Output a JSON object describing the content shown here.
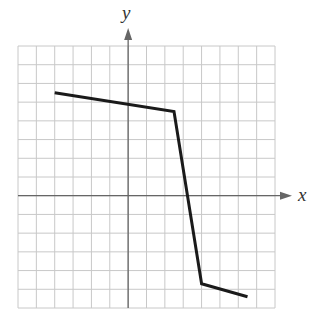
{
  "chart_data": {
    "type": "line",
    "title": "",
    "xlabel": "x",
    "ylabel": "y",
    "xlim": [
      -6,
      8
    ],
    "ylim": [
      -6,
      8
    ],
    "grid": true,
    "grid_step": 1,
    "tick_labels": false,
    "series": [
      {
        "name": "piecewise-linear",
        "points": [
          {
            "x": -4,
            "y": 5.5
          },
          {
            "x": 2.5,
            "y": 4.5
          },
          {
            "x": 4,
            "y": -4.7
          },
          {
            "x": 6.5,
            "y": -5.4
          }
        ]
      }
    ]
  },
  "colors": {
    "grid": "#c8c8c8",
    "axis": "#666666",
    "line": "#1a1a1a",
    "label": "#333333"
  },
  "labels": {
    "x_axis": "x",
    "y_axis": "y"
  }
}
